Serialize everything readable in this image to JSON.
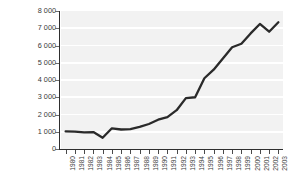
{
  "chart_data": {
    "type": "line",
    "title": "",
    "subtitle": "",
    "xlabel": "",
    "ylabel": "Millions of United States dollars",
    "ylim": [
      0,
      8000
    ],
    "y_ticks": [
      0,
      1000,
      2000,
      3000,
      4000,
      5000,
      6000,
      7000,
      8000
    ],
    "y_tick_labels": [
      "0",
      "1 000",
      "2 000",
      "3 000",
      "4 000",
      "5 000",
      "6 000",
      "7 000",
      "8 000"
    ],
    "grid": "horizontal",
    "legend": "none",
    "categories": [
      "1980",
      "1981",
      "1982",
      "1983",
      "1984",
      "1985",
      "1986",
      "1987",
      "1988",
      "1989",
      "1990",
      "1991",
      "1992",
      "1993",
      "1994",
      "1995",
      "1996",
      "1997",
      "1998",
      "1999",
      "2000",
      "2001",
      "2002",
      "2003"
    ],
    "values": [
      1020,
      1010,
      960,
      980,
      650,
      1200,
      1130,
      1150,
      1280,
      1450,
      1700,
      1850,
      2250,
      2950,
      3000,
      4100,
      4600,
      5250,
      5900,
      6100,
      6700,
      7250,
      6800,
      7350
    ],
    "series": [
      {
        "name": "Millions of United States dollars",
        "color": "#2a2a2a",
        "values": [
          1020,
          1010,
          960,
          980,
          650,
          1200,
          1130,
          1150,
          1280,
          1450,
          1700,
          1850,
          2250,
          2950,
          3000,
          4100,
          4600,
          5250,
          5900,
          6100,
          6700,
          7250,
          6800,
          7350
        ]
      }
    ],
    "colors": {
      "line": "#2a2a2a",
      "plot_background": "#f2f2f2",
      "gridline": "#ffffff",
      "axis": "#2e2e2e",
      "text": "#3a3a3a",
      "figure_background": "#ffffff"
    }
  }
}
